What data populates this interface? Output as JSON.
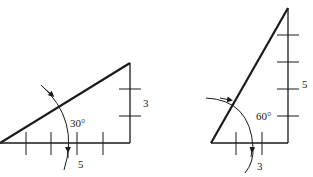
{
  "figures": [
    {
      "id": "left-triangle",
      "angle_label": "30°",
      "horizontal_leg_label": "5",
      "vertical_leg_label": "3",
      "horizontal_ticks": 4,
      "vertical_ticks": 2
    },
    {
      "id": "right-triangle",
      "angle_label": "60°",
      "horizontal_leg_label": "3",
      "vertical_leg_label": "5",
      "horizontal_ticks": 2,
      "vertical_ticks": 4
    }
  ],
  "colors": {
    "stroke": "#1a1a1a",
    "background": "#ffffff"
  }
}
